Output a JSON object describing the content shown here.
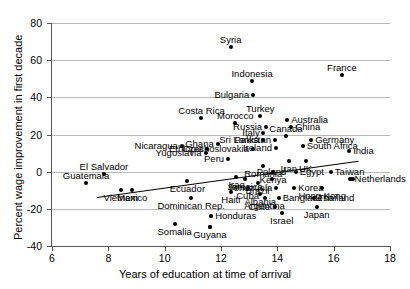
{
  "chart_data": {
    "type": "scatter",
    "title": "",
    "xlabel": "Years of education at time of arrival",
    "ylabel": "Percent wage improvement in first decade",
    "xlim": [
      6,
      18
    ],
    "ylim": [
      -40,
      80
    ],
    "xticks": [
      6,
      8,
      10,
      12,
      14,
      16,
      18
    ],
    "yticks": [
      -40,
      -20,
      0,
      20,
      40,
      60,
      80
    ],
    "grid": "horizontal",
    "legend": "none",
    "trendline": {
      "x0": 7.6,
      "y0": -13.5,
      "x1": 16.9,
      "y1": 6.0
    },
    "points": [
      {
        "label": "Syria",
        "x": 12.35,
        "y": 67,
        "label_pos": "top"
      },
      {
        "label": "France",
        "x": 16.3,
        "y": 52,
        "label_pos": "top"
      },
      {
        "label": "Indonesia",
        "x": 13.1,
        "y": 49,
        "label_pos": "top"
      },
      {
        "label": "Bulgaria",
        "x": 13.15,
        "y": 41,
        "label_pos": "left"
      },
      {
        "label": "Costa Rica",
        "x": 11.3,
        "y": 29,
        "label_pos": "top"
      },
      {
        "label": "Turkey",
        "x": 13.4,
        "y": 30,
        "label_pos": "top"
      },
      {
        "label": "Australia",
        "x": 14.35,
        "y": 28,
        "label_pos": "right"
      },
      {
        "label": "Morocco",
        "x": 12.5,
        "y": 26,
        "label_pos": "top"
      },
      {
        "label": "Russia",
        "x": 13.6,
        "y": 24,
        "label_pos": "left"
      },
      {
        "label": "China",
        "x": 14.5,
        "y": 24,
        "label_pos": "right"
      },
      {
        "label": "Italy",
        "x": 13.5,
        "y": 21,
        "label_pos": "left"
      },
      {
        "label": "Canada",
        "x": 14.3,
        "y": 19,
        "label_pos": "top"
      },
      {
        "label": "Sri Lanka",
        "x": 13.5,
        "y": 17,
        "label_pos": "left"
      },
      {
        "label": "Pakistan",
        "x": 13.9,
        "y": 17,
        "label_pos": "left"
      },
      {
        "label": "Germany",
        "x": 15.2,
        "y": 17,
        "label_pos": "right"
      },
      {
        "label": "Ghana",
        "x": 11.9,
        "y": 15,
        "label_pos": "left"
      },
      {
        "label": "Ireland",
        "x": 13.95,
        "y": 13,
        "label_pos": "left"
      },
      {
        "label": "South Africa",
        "x": 14.9,
        "y": 14,
        "label_pos": "right"
      },
      {
        "label": "Nicaragua",
        "x": 10.6,
        "y": 14,
        "label_pos": "left"
      },
      {
        "label": "Ethiopia",
        "x": 11.5,
        "y": 12,
        "label_pos": "left"
      },
      {
        "label": "Czechoslovakia",
        "x": 13.15,
        "y": 12,
        "label_pos": "left"
      },
      {
        "label": "Yugoslavia",
        "x": 11.45,
        "y": 10,
        "label_pos": "left"
      },
      {
        "label": "India",
        "x": 16.55,
        "y": 11,
        "label_pos": "right"
      },
      {
        "label": "Peru",
        "x": 12.25,
        "y": 7,
        "label_pos": "left"
      },
      {
        "label": "Iran",
        "x": 14.4,
        "y": 6,
        "label_pos": "bottom"
      },
      {
        "label": "UK",
        "x": 15.0,
        "y": 6,
        "label_pos": "bottom"
      },
      {
        "label": "Romania",
        "x": 13.5,
        "y": 3,
        "label_pos": "bottom"
      },
      {
        "label": "Kenya",
        "x": 13.85,
        "y": 0,
        "label_pos": "bottom"
      },
      {
        "label": "Egypt",
        "x": 14.65,
        "y": 0,
        "label_pos": "right"
      },
      {
        "label": "Taiwan",
        "x": 15.9,
        "y": 0,
        "label_pos": "right"
      },
      {
        "label": "El Salvador",
        "x": 7.85,
        "y": -1,
        "label_pos": "top"
      },
      {
        "label": "Iraq",
        "x": 12.55,
        "y": -3,
        "label_pos": "bottom"
      },
      {
        "label": "Jamaica",
        "x": 12.85,
        "y": -4,
        "label_pos": "bottom"
      },
      {
        "label": "Poland",
        "x": 13.8,
        "y": -4,
        "label_pos": "top"
      },
      {
        "label": "Netherlands",
        "x": 16.6,
        "y": -4,
        "label_pos": "right"
      },
      {
        "label": "Guatemala",
        "x": 7.2,
        "y": -6,
        "label_pos": "top"
      },
      {
        "label": "Brazil",
        "x": 13.3,
        "y": -6,
        "label_pos": "bottom"
      },
      {
        "label": "Ecuador",
        "x": 10.8,
        "y": -5,
        "label_pos": "bottom"
      },
      {
        "label": "Cuba",
        "x": 12.95,
        "y": -9,
        "label_pos": "bottom"
      },
      {
        "label": "Venezuela",
        "x": 13.95,
        "y": -9,
        "label_pos": "left"
      },
      {
        "label": "Korea",
        "x": 14.6,
        "y": -9,
        "label_pos": "right"
      },
      {
        "label": "Hong Kong",
        "x": 15.6,
        "y": -9,
        "label_pos": "bottom"
      },
      {
        "label": "Vietnam",
        "x": 8.45,
        "y": -10,
        "label_pos": "bottom"
      },
      {
        "label": "Mexico",
        "x": 8.85,
        "y": -10,
        "label_pos": "bottom"
      },
      {
        "label": "Haiti",
        "x": 12.35,
        "y": -11,
        "label_pos": "bottom"
      },
      {
        "label": "Albania",
        "x": 13.4,
        "y": -12,
        "label_pos": "bottom"
      },
      {
        "label": "Dominican Rep.",
        "x": 10.95,
        "y": -14,
        "label_pos": "bottom"
      },
      {
        "label": "Bangladesh",
        "x": 14.05,
        "y": -14,
        "label_pos": "right"
      },
      {
        "label": "Thailand",
        "x": 15.3,
        "y": -14,
        "label_pos": "right"
      },
      {
        "label": "Argentina",
        "x": 13.55,
        "y": -14,
        "label_pos": "bottom"
      },
      {
        "label": "Chile",
        "x": 13.9,
        "y": -19,
        "label_pos": "left"
      },
      {
        "label": "Japan",
        "x": 15.4,
        "y": -19,
        "label_pos": "bottom"
      },
      {
        "label": "Israel",
        "x": 14.15,
        "y": -22,
        "label_pos": "bottom"
      },
      {
        "label": "Honduras",
        "x": 11.65,
        "y": -24,
        "label_pos": "right"
      },
      {
        "label": "Somalia",
        "x": 10.35,
        "y": -28,
        "label_pos": "bottom"
      },
      {
        "label": "Guyana",
        "x": 11.6,
        "y": -30,
        "label_pos": "bottom"
      }
    ],
    "unlabeled_points": [
      {
        "x": 11.65,
        "y": -24
      },
      {
        "x": 11.6,
        "y": -30
      }
    ]
  }
}
